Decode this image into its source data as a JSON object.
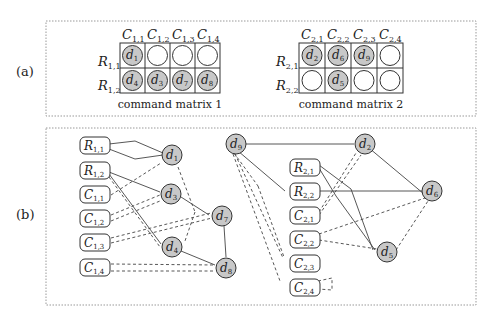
{
  "panels": {
    "a_label": "(a)",
    "b_label": "(b)"
  },
  "matrix1": {
    "caption": "command matrix 1",
    "columns": [
      "C1,1",
      "C1,2",
      "C1,3",
      "C1,4"
    ],
    "rows": [
      "R1,1",
      "R1,2"
    ],
    "cells": [
      [
        "d1",
        "",
        "",
        ""
      ],
      [
        "d4",
        "d3",
        "d7",
        "d8"
      ]
    ]
  },
  "matrix2": {
    "caption": "command matrix 2",
    "columns": [
      "C2,1",
      "C2,2",
      "C2,3",
      "C2,4"
    ],
    "rows": [
      "R2,1",
      "R2,2"
    ],
    "cells": [
      [
        "d2",
        "d6",
        "d9",
        ""
      ],
      [
        "",
        "d5",
        "",
        ""
      ]
    ]
  },
  "graph": {
    "left_boxes": [
      "R1,1",
      "R1,2",
      "C1,1",
      "C1,2",
      "C1,3",
      "C1,4"
    ],
    "right_boxes": [
      "R2,1",
      "R2,2",
      "C2,1",
      "C2,2",
      "C2,3",
      "C2,4"
    ],
    "nodes": [
      "d1",
      "d2",
      "d3",
      "d4",
      "d5",
      "d6",
      "d7",
      "d8",
      "d9"
    ]
  },
  "colors": {
    "node_fill": "#c8c8c8",
    "stroke": "#333333",
    "frame": "#999999"
  }
}
